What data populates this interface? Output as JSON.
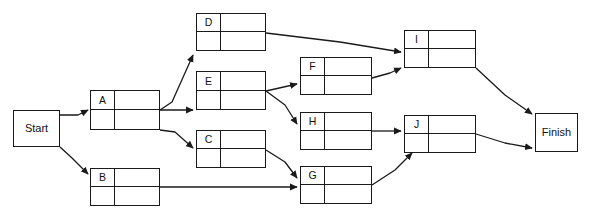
{
  "diagram": {
    "type": "activity-on-node-network",
    "canvas": {
      "width": 594,
      "height": 222,
      "background": "#ffffff"
    },
    "line_color": "#1a1a1a",
    "text_color": "#111111"
  },
  "terminals": [
    {
      "key": "start",
      "label": "Start",
      "x": 13,
      "y": 110,
      "w": 47,
      "h": 37
    },
    {
      "key": "finish",
      "label": "Finish",
      "x": 535,
      "y": 113,
      "w": 43,
      "h": 39
    }
  ],
  "activities": [
    {
      "key": "a",
      "label": "A",
      "x": 90,
      "y": 90,
      "w": 70,
      "h": 40
    },
    {
      "key": "b",
      "label": "B",
      "x": 90,
      "y": 168,
      "w": 70,
      "h": 38
    },
    {
      "key": "d",
      "label": "D",
      "x": 196,
      "y": 13,
      "w": 70,
      "h": 38
    },
    {
      "key": "e",
      "label": "E",
      "x": 196,
      "y": 71,
      "w": 70,
      "h": 39
    },
    {
      "key": "c",
      "label": "C",
      "x": 196,
      "y": 130,
      "w": 70,
      "h": 38
    },
    {
      "key": "f",
      "label": "F",
      "x": 300,
      "y": 57,
      "w": 72,
      "h": 38
    },
    {
      "key": "h",
      "label": "H",
      "x": 300,
      "y": 112,
      "w": 72,
      "h": 38
    },
    {
      "key": "g",
      "label": "G",
      "x": 300,
      "y": 166,
      "w": 72,
      "h": 38
    },
    {
      "key": "i",
      "label": "I",
      "x": 404,
      "y": 30,
      "w": 72,
      "h": 38
    },
    {
      "key": "j",
      "label": "J",
      "x": 404,
      "y": 115,
      "w": 72,
      "h": 38
    }
  ],
  "edges": [
    {
      "from": "start",
      "to": "a",
      "points": "60,115 78,115 88,110"
    },
    {
      "from": "start",
      "to": "b",
      "points": "60,147 72,158 88,174"
    },
    {
      "from": "a",
      "to": "d",
      "points": "160,110 172,102 193,55"
    },
    {
      "from": "a",
      "to": "e",
      "points": "160,110 193,110"
    },
    {
      "from": "a",
      "to": "c",
      "points": "160,130 175,132 193,148"
    },
    {
      "from": "b",
      "to": "g",
      "points": "160,187 297,187"
    },
    {
      "from": "d",
      "to": "i",
      "points": "266,33 340,42 401,52"
    },
    {
      "from": "e",
      "to": "f",
      "points": "266,91 297,84"
    },
    {
      "from": "e",
      "to": "h",
      "points": "266,91 285,105 297,124"
    },
    {
      "from": "c",
      "to": "g",
      "points": "266,150 285,162 297,178"
    },
    {
      "from": "f",
      "to": "i",
      "points": "372,78 390,73 401,68"
    },
    {
      "from": "h",
      "to": "j",
      "points": "372,131 401,131"
    },
    {
      "from": "g",
      "to": "j",
      "points": "372,185 395,170 412,153"
    },
    {
      "from": "i",
      "to": "finish",
      "points": "476,68 505,95 532,114"
    },
    {
      "from": "j",
      "to": "finish",
      "points": "476,134 505,143 532,148"
    }
  ]
}
